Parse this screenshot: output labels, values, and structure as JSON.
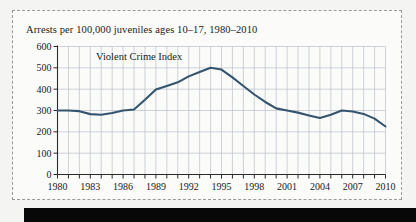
{
  "figure": {
    "title": "Arrests per 100,000 juveniles ages 10–17, 1980–2010",
    "background_color": "#fbfbfa",
    "border_color": "#9a9a96",
    "scan_bar_color": "#080808"
  },
  "chart_data": {
    "type": "line",
    "title": "Arrests per 100,000 juveniles ages 10–17, 1980–2010",
    "xlabel": "",
    "ylabel": "",
    "xlim": [
      1980,
      2010
    ],
    "ylim": [
      0,
      600
    ],
    "grid": true,
    "legend_position": "inline-label",
    "y_ticks": [
      0,
      100,
      200,
      300,
      400,
      500,
      600
    ],
    "y_tick_labels": [
      "0",
      "100",
      "200",
      "300",
      "400",
      "500",
      "600"
    ],
    "x_ticks": [
      1980,
      1981,
      1982,
      1983,
      1984,
      1985,
      1986,
      1987,
      1988,
      1989,
      1990,
      1991,
      1992,
      1993,
      1994,
      1995,
      1996,
      1997,
      1998,
      1999,
      2000,
      2001,
      2002,
      2003,
      2004,
      2005,
      2006,
      2007,
      2008,
      2009,
      2010
    ],
    "x_tick_labels_shown": [
      "1980",
      "1983",
      "1986",
      "1989",
      "1992",
      "1995",
      "1998",
      "2001",
      "2004",
      "2007",
      "2010"
    ],
    "x_tick_label_step": 3,
    "series": [
      {
        "name": "Violent Crime Index",
        "color": "#35546e",
        "annotation": "Violent Crime Index",
        "x": [
          1980,
          1981,
          1982,
          1983,
          1984,
          1985,
          1986,
          1987,
          1988,
          1989,
          1990,
          1991,
          1992,
          1993,
          1994,
          1995,
          1996,
          1997,
          1998,
          1999,
          2000,
          2001,
          2002,
          2003,
          2004,
          2005,
          2006,
          2007,
          2008,
          2009,
          2010
        ],
        "values": [
          300,
          300,
          297,
          283,
          280,
          288,
          300,
          305,
          350,
          398,
          415,
          432,
          460,
          480,
          500,
          492,
          455,
          415,
          375,
          340,
          310,
          300,
          290,
          277,
          265,
          280,
          300,
          295,
          284,
          262,
          225
        ]
      }
    ]
  },
  "annotations": {
    "series_label": "Violent Crime Index"
  }
}
